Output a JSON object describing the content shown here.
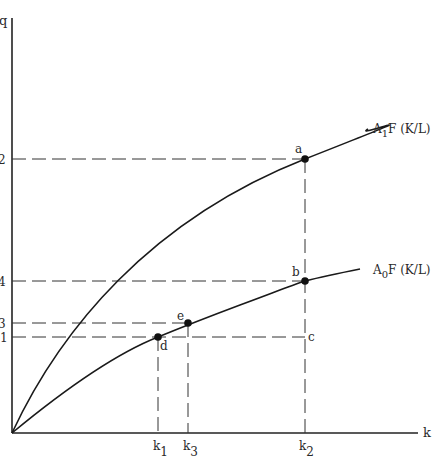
{
  "diagram": {
    "axes": {
      "y_label": "q",
      "x_label": "k"
    },
    "curves": [
      {
        "id": "upper",
        "label_main": "A",
        "label_sub": "1",
        "label_rest": "F  (K/L)"
      },
      {
        "id": "lower",
        "label_main": "A",
        "label_sub": "0",
        "label_rest": "F  (K/L)"
      }
    ],
    "points": [
      {
        "id": "a",
        "label": "a"
      },
      {
        "id": "b",
        "label": "b"
      },
      {
        "id": "c",
        "label": "c"
      },
      {
        "id": "d",
        "label": "d"
      },
      {
        "id": "e",
        "label": "e"
      }
    ],
    "y_ticks": [
      {
        "id": "q2",
        "label": "2"
      },
      {
        "id": "q4",
        "label": "4"
      },
      {
        "id": "q3",
        "label": "3"
      },
      {
        "id": "q1",
        "label": "1"
      }
    ],
    "x_ticks": [
      {
        "id": "k1",
        "main": "k",
        "sub": "1"
      },
      {
        "id": "k3",
        "main": "k",
        "sub": "3"
      },
      {
        "id": "k2",
        "main": "k",
        "sub": "2"
      }
    ]
  }
}
